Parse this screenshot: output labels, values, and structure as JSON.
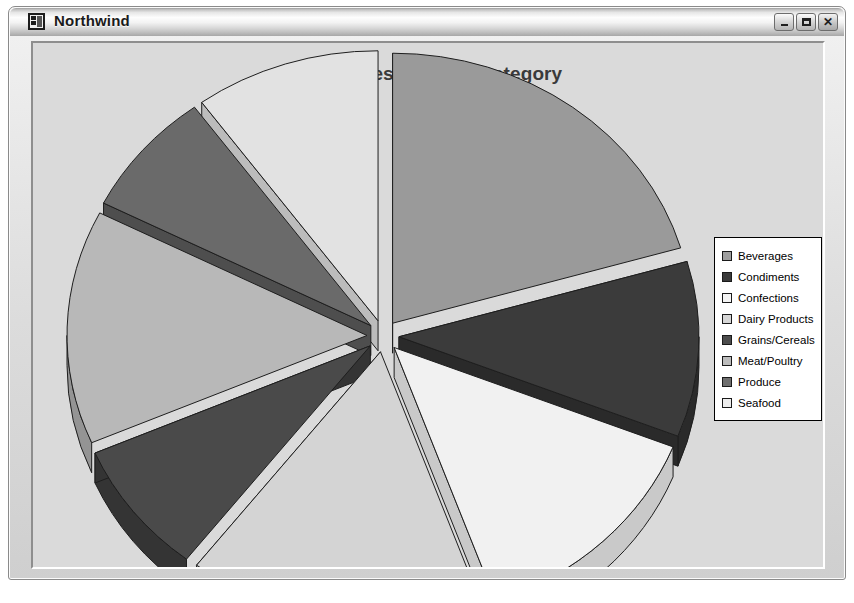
{
  "window": {
    "title": "Northwind",
    "icon": "form-icon",
    "buttons": [
      {
        "name": "minimize-button",
        "label": "–"
      },
      {
        "name": "maximize-button",
        "label": "□"
      },
      {
        "name": "close-button",
        "label": "✕"
      }
    ]
  },
  "chart_data": {
    "type": "pie",
    "title": "Total Sales by Food Category",
    "subtitle": "",
    "xlabel": "",
    "ylabel": "",
    "exploded": true,
    "three_d": true,
    "legend_position": "right",
    "grid": false,
    "categories": [
      "Beverages",
      "Condiments",
      "Confections",
      "Dairy Products",
      "Grains/Cereals",
      "Meat/Poultry",
      "Produce",
      "Seafood"
    ],
    "values": [
      20.5,
      10.5,
      13.5,
      16.0,
      8.0,
      14.0,
      7.5,
      10.0
    ],
    "value_unit": "percent",
    "colors": [
      "#9a9a9a",
      "#3b3b3b",
      "#f1f1f1",
      "#d4d4d4",
      "#4a4a4a",
      "#b8b8b8",
      "#6a6a6a",
      "#e2e2e2"
    ],
    "side_colors": [
      "#787878",
      "#2a2a2a",
      "#c9c9c9",
      "#ababab",
      "#343434",
      "#949494",
      "#4e4e4e",
      "#bcbcbc"
    ],
    "start_angles": [
      -85,
      -10,
      40,
      88,
      146,
      176,
      228,
      268
    ],
    "end_angles": [
      -10,
      40,
      88,
      146,
      176,
      228,
      268,
      275
    ]
  },
  "legend": {
    "items": [
      {
        "label": "Beverages",
        "swatch": "#9e9e9e"
      },
      {
        "label": "Condiments",
        "swatch": "#3a3a3a"
      },
      {
        "label": "Confections",
        "swatch": "#f4f4f4"
      },
      {
        "label": "Dairy Products",
        "swatch": "#d6d6d6"
      },
      {
        "label": "Grains/Cereals",
        "swatch": "#4c4c4c"
      },
      {
        "label": "Meat/Poultry",
        "swatch": "#bcbcbc"
      },
      {
        "label": "Produce",
        "swatch": "#6e6e6e"
      },
      {
        "label": "Seafood",
        "swatch": "#ededed"
      }
    ]
  }
}
